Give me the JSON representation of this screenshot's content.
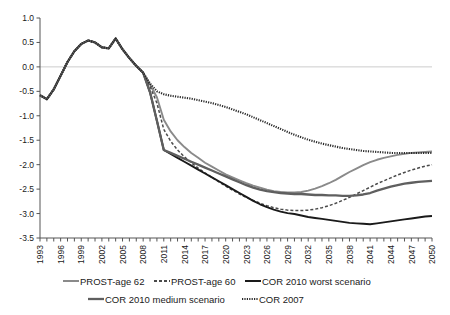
{
  "chart_data": {
    "type": "line",
    "title": "",
    "xlabel": "",
    "ylabel": "",
    "xlim": [
      1993,
      2050
    ],
    "ylim": [
      -3.5,
      1.0
    ],
    "ytick_step": 0.5,
    "xtick_label_step": 3,
    "grid": false,
    "zero_line": true,
    "legend_position": "bottom",
    "yticks": [
      "1.0",
      "0.5",
      "0.0",
      "-0.5",
      "-1.0",
      "-1.5",
      "-2.0",
      "-2.5",
      "-3.0",
      "-3.5"
    ],
    "ytick_values": [
      1.0,
      0.5,
      0.0,
      -0.5,
      -1.0,
      -1.5,
      -2.0,
      -2.5,
      -3.0,
      -3.5
    ],
    "xticks": [
      "1993",
      "1996",
      "1999",
      "2002",
      "2005",
      "2008",
      "2011",
      "2014",
      "2017",
      "2020",
      "2023",
      "2026",
      "2029",
      "2032",
      "2035",
      "2038",
      "2041",
      "2044",
      "2047",
      "2050"
    ],
    "xtick_values": [
      1993,
      1996,
      1999,
      2002,
      2005,
      2008,
      2011,
      2014,
      2017,
      2020,
      2023,
      2026,
      2029,
      2032,
      2035,
      2038,
      2041,
      2044,
      2047,
      2050
    ],
    "series": [
      {
        "name": "PROST-age 62",
        "color": "#8a8a8a",
        "width": 1.9,
        "dash": "none",
        "x": [
          1993,
          1994,
          1995,
          1996,
          1997,
          1998,
          1999,
          2000,
          2001,
          2002,
          2003,
          2004,
          2005,
          2006,
          2007,
          2008,
          2009,
          2010,
          2011,
          2012,
          2013,
          2014,
          2015,
          2016,
          2017,
          2018,
          2019,
          2020,
          2021,
          2022,
          2023,
          2024,
          2025,
          2026,
          2027,
          2028,
          2029,
          2030,
          2031,
          2032,
          2033,
          2034,
          2035,
          2036,
          2037,
          2038,
          2039,
          2040,
          2041,
          2042,
          2043,
          2044,
          2045,
          2046,
          2047,
          2048,
          2049,
          2050
        ],
        "y": [
          -0.58,
          -0.66,
          -0.46,
          -0.18,
          0.1,
          0.32,
          0.47,
          0.54,
          0.5,
          0.4,
          0.38,
          0.58,
          0.36,
          0.18,
          0.02,
          -0.12,
          -0.36,
          -0.62,
          -1.08,
          -1.32,
          -1.5,
          -1.64,
          -1.76,
          -1.86,
          -1.96,
          -2.04,
          -2.12,
          -2.2,
          -2.26,
          -2.32,
          -2.38,
          -2.43,
          -2.47,
          -2.51,
          -2.54,
          -2.56,
          -2.57,
          -2.57,
          -2.56,
          -2.53,
          -2.49,
          -2.44,
          -2.38,
          -2.31,
          -2.23,
          -2.15,
          -2.08,
          -2.01,
          -1.95,
          -1.9,
          -1.86,
          -1.83,
          -1.8,
          -1.78,
          -1.76,
          -1.75,
          -1.74,
          -1.73
        ]
      },
      {
        "name": "PROST-age 60",
        "color": "#4a4a4a",
        "width": 1.5,
        "dash": "3,2",
        "x": [
          1993,
          1994,
          1995,
          1996,
          1997,
          1998,
          1999,
          2000,
          2001,
          2002,
          2003,
          2004,
          2005,
          2006,
          2007,
          2008,
          2009,
          2010,
          2011,
          2012,
          2013,
          2014,
          2015,
          2016,
          2017,
          2018,
          2019,
          2020,
          2021,
          2022,
          2023,
          2024,
          2025,
          2026,
          2027,
          2028,
          2029,
          2030,
          2031,
          2032,
          2033,
          2034,
          2035,
          2036,
          2037,
          2038,
          2039,
          2040,
          2041,
          2042,
          2043,
          2044,
          2045,
          2046,
          2047,
          2048,
          2049,
          2050
        ],
        "y": [
          -0.58,
          -0.66,
          -0.46,
          -0.18,
          0.1,
          0.32,
          0.47,
          0.54,
          0.5,
          0.4,
          0.38,
          0.58,
          0.36,
          0.18,
          0.02,
          -0.12,
          -0.4,
          -0.74,
          -1.28,
          -1.52,
          -1.7,
          -1.84,
          -1.96,
          -2.07,
          -2.17,
          -2.26,
          -2.35,
          -2.44,
          -2.52,
          -2.6,
          -2.67,
          -2.73,
          -2.79,
          -2.84,
          -2.88,
          -2.91,
          -2.93,
          -2.94,
          -2.94,
          -2.93,
          -2.91,
          -2.88,
          -2.84,
          -2.79,
          -2.73,
          -2.67,
          -2.6,
          -2.53,
          -2.46,
          -2.39,
          -2.33,
          -2.27,
          -2.21,
          -2.16,
          -2.11,
          -2.07,
          -2.03,
          -2.0
        ]
      },
      {
        "name": "COR 2010 worst scenario",
        "color": "#1a1a1a",
        "width": 1.9,
        "dash": "none",
        "x": [
          1993,
          1994,
          1995,
          1996,
          1997,
          1998,
          1999,
          2000,
          2001,
          2002,
          2003,
          2004,
          2005,
          2006,
          2007,
          2008,
          2009,
          2010,
          2011,
          2012,
          2013,
          2014,
          2015,
          2016,
          2017,
          2018,
          2019,
          2020,
          2021,
          2022,
          2023,
          2024,
          2025,
          2026,
          2027,
          2028,
          2029,
          2030,
          2031,
          2032,
          2033,
          2034,
          2035,
          2036,
          2037,
          2038,
          2039,
          2040,
          2041,
          2042,
          2043,
          2044,
          2045,
          2046,
          2047,
          2048,
          2049,
          2050
        ],
        "y": [
          -0.58,
          -0.66,
          -0.46,
          -0.18,
          0.1,
          0.32,
          0.47,
          0.54,
          0.5,
          0.4,
          0.38,
          0.58,
          0.36,
          0.18,
          0.02,
          -0.12,
          -0.52,
          -1.1,
          -1.7,
          -1.78,
          -1.86,
          -1.94,
          -2.02,
          -2.1,
          -2.18,
          -2.26,
          -2.34,
          -2.42,
          -2.5,
          -2.58,
          -2.66,
          -2.74,
          -2.81,
          -2.87,
          -2.92,
          -2.96,
          -2.99,
          -3.01,
          -3.04,
          -3.07,
          -3.09,
          -3.11,
          -3.13,
          -3.15,
          -3.17,
          -3.19,
          -3.2,
          -3.21,
          -3.22,
          -3.2,
          -3.18,
          -3.16,
          -3.14,
          -3.12,
          -3.1,
          -3.08,
          -3.06,
          -3.05
        ]
      },
      {
        "name": "COR 2010 medium scenario",
        "color": "#5f5f5f",
        "width": 2.3,
        "dash": "none",
        "x": [
          1993,
          1994,
          1995,
          1996,
          1997,
          1998,
          1999,
          2000,
          2001,
          2002,
          2003,
          2004,
          2005,
          2006,
          2007,
          2008,
          2009,
          2010,
          2011,
          2012,
          2013,
          2014,
          2015,
          2016,
          2017,
          2018,
          2019,
          2020,
          2021,
          2022,
          2023,
          2024,
          2025,
          2026,
          2027,
          2028,
          2029,
          2030,
          2031,
          2032,
          2033,
          2034,
          2035,
          2036,
          2037,
          2038,
          2039,
          2040,
          2041,
          2042,
          2043,
          2044,
          2045,
          2046,
          2047,
          2048,
          2049,
          2050
        ],
        "y": [
          -0.58,
          -0.66,
          -0.46,
          -0.18,
          0.1,
          0.32,
          0.47,
          0.54,
          0.5,
          0.4,
          0.38,
          0.58,
          0.36,
          0.18,
          0.02,
          -0.12,
          -0.52,
          -1.1,
          -1.7,
          -1.76,
          -1.82,
          -1.88,
          -1.94,
          -2.0,
          -2.06,
          -2.12,
          -2.18,
          -2.24,
          -2.3,
          -2.36,
          -2.42,
          -2.47,
          -2.51,
          -2.54,
          -2.56,
          -2.58,
          -2.59,
          -2.6,
          -2.6,
          -2.61,
          -2.62,
          -2.62,
          -2.63,
          -2.63,
          -2.64,
          -2.64,
          -2.63,
          -2.61,
          -2.58,
          -2.53,
          -2.49,
          -2.45,
          -2.42,
          -2.39,
          -2.37,
          -2.35,
          -2.34,
          -2.33
        ]
      },
      {
        "name": "COR 2007",
        "color": "#2a2a2a",
        "width": 2.1,
        "dash": "1.2,1.2",
        "x": [
          1993,
          1994,
          1995,
          1996,
          1997,
          1998,
          1999,
          2000,
          2001,
          2002,
          2003,
          2004,
          2005,
          2006,
          2007,
          2008,
          2009,
          2010,
          2011,
          2012,
          2013,
          2014,
          2015,
          2016,
          2017,
          2018,
          2019,
          2020,
          2021,
          2022,
          2023,
          2024,
          2025,
          2026,
          2027,
          2028,
          2029,
          2030,
          2031,
          2032,
          2033,
          2034,
          2035,
          2036,
          2037,
          2038,
          2039,
          2040,
          2041,
          2042,
          2043,
          2044,
          2045,
          2046,
          2047,
          2048,
          2049,
          2050
        ],
        "y": [
          -0.58,
          -0.66,
          -0.46,
          -0.18,
          0.1,
          0.32,
          0.47,
          0.54,
          0.5,
          0.4,
          0.38,
          0.58,
          0.36,
          0.18,
          0.02,
          -0.12,
          -0.34,
          -0.5,
          -0.56,
          -0.59,
          -0.61,
          -0.63,
          -0.65,
          -0.68,
          -0.71,
          -0.74,
          -0.78,
          -0.82,
          -0.87,
          -0.92,
          -0.97,
          -1.03,
          -1.09,
          -1.15,
          -1.21,
          -1.27,
          -1.33,
          -1.39,
          -1.44,
          -1.49,
          -1.53,
          -1.57,
          -1.6,
          -1.63,
          -1.66,
          -1.68,
          -1.7,
          -1.72,
          -1.73,
          -1.74,
          -1.75,
          -1.76,
          -1.76,
          -1.76,
          -1.76,
          -1.76,
          -1.76,
          -1.76
        ]
      }
    ]
  },
  "legend": {
    "row1": [
      {
        "label": "PROST-age 62",
        "series_index": 0
      },
      {
        "label": "PROST-age 60",
        "series_index": 1
      },
      {
        "label": "COR 2010 worst scenario",
        "series_index": 2
      }
    ],
    "row2": [
      {
        "label": "COR 2010 medium scenario",
        "series_index": 3
      },
      {
        "label": "COR 2007",
        "series_index": 4
      }
    ]
  }
}
